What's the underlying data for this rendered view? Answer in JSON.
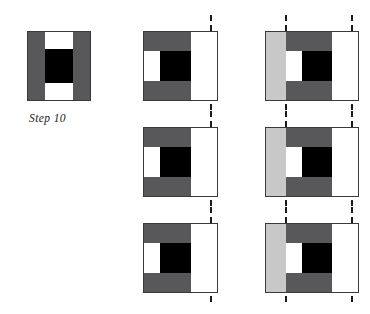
{
  "figure": {
    "caption": "Step 10",
    "colors": {
      "dark_gray": "#58585a",
      "light_gray": "#c8c8c8",
      "black": "#000000",
      "white": "#ffffff",
      "outline": "#3a3a3a",
      "dashed_line": "#1a1a1a",
      "background": "#ffffff"
    },
    "columns": [
      {
        "name": "step-10-panel",
        "rows": 1,
        "dashed_lines": 0,
        "description": "square tile with vertical dark gray bars at left and right, white blocks top and bottom of center, black center block"
      },
      {
        "name": "one-line-panel",
        "rows": 3,
        "dashed_lines": 1,
        "description": "tile with dark gray horizontal bands top and bottom, white vertical strip at left, black center block, white extension panel at right; single dashed vertical line at right"
      },
      {
        "name": "two-line-panel",
        "rows": 3,
        "dashed_lines": 2,
        "description": "tile with light gray panel at left, dark gray horizontal bands top and bottom, white vertical strip, black center block, white panel at right; two dashed vertical lines"
      }
    ]
  }
}
